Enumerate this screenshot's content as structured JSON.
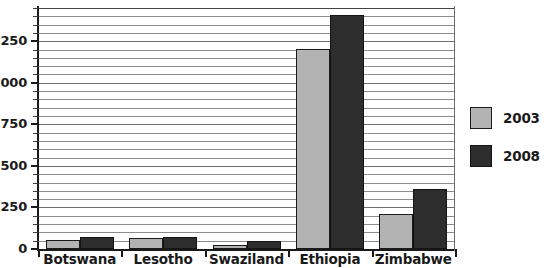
{
  "chart_data": {
    "type": "bar",
    "title": "",
    "xlabel": "",
    "ylabel": "",
    "categories": [
      "Botswana",
      "Lesotho",
      "Swaziland",
      "Ethiopia",
      "Zimbabwe"
    ],
    "series": [
      {
        "name": "2003",
        "color": "#b3b3b3",
        "values": [
          55,
          65,
          25,
          1205,
          210
        ]
      },
      {
        "name": "2008",
        "color": "#2d2d2d",
        "values": [
          70,
          70,
          50,
          1405,
          360
        ]
      }
    ],
    "ylim": [
      0,
      1450
    ],
    "y_major_ticks": [
      0,
      250,
      500,
      750,
      1000,
      1250
    ],
    "y_tick_labels": [
      "0",
      "250",
      "500",
      "750",
      "1000",
      "1250"
    ],
    "y_minor_tick_step": 50,
    "grid": true,
    "grid_orientation": "horizontal",
    "legend_position": "right",
    "legend": [
      {
        "label": "2003",
        "color": "#b3b3b3"
      },
      {
        "label": "2008",
        "color": "#2d2d2d"
      }
    ]
  }
}
